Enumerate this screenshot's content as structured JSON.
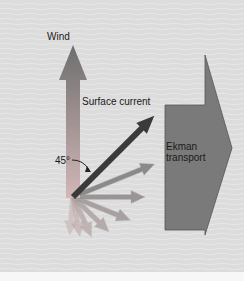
{
  "labels": {
    "wind": "Wind",
    "surface_current": "Surface current",
    "ekman_line1": "Ekman",
    "ekman_line2": "transport",
    "angle": "45°"
  },
  "colors": {
    "background": "#dcdcdc",
    "wave_line": "#ececec",
    "bottom_strip": "#f7f7f7",
    "wind_top": "#6e6e6e",
    "wind_bottom": "#d3b7b7",
    "surface_current": "#3a3a3a",
    "ekman_fill": "#7a7a7a",
    "ekman_stroke": "#555555",
    "spiral_arrow_dark": "#8a8a8a",
    "spiral_arrow_light": "#c9b0b0",
    "angle_arc": "#222222"
  },
  "diagram": {
    "spiral_arrow_count": 7,
    "spiral_rotation_step_deg": 22,
    "surface_current_angle_from_wind_deg": 45
  }
}
